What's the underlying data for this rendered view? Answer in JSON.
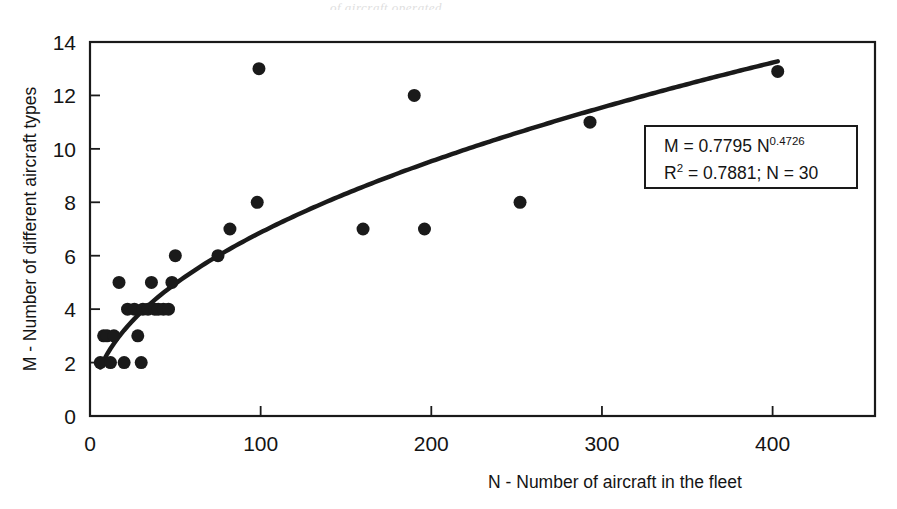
{
  "figure": {
    "background_color": "#ffffff",
    "ink_color": "#1a1a1a",
    "smudge_text": "of aircraft operated"
  },
  "chart_data": {
    "type": "scatter",
    "title": "",
    "subtitle": "",
    "xlabel": "N - Number of aircraft in the fleet",
    "ylabel": "M - Number of different aircraft types",
    "xlim": [
      0,
      460
    ],
    "ylim": [
      0,
      14
    ],
    "xticks": [
      0,
      100,
      200,
      300,
      400
    ],
    "yticks": [
      0,
      2,
      4,
      6,
      8,
      10,
      12,
      14
    ],
    "xtick_labels": [
      "0",
      "100",
      "200",
      "300",
      "400"
    ],
    "ytick_labels": [
      "0",
      "2",
      "4",
      "6",
      "8",
      "10",
      "12",
      "14"
    ],
    "grid": false,
    "legend": null,
    "marker": {
      "shape": "circle",
      "color": "#1a1a1a",
      "size_px": 13
    },
    "points": [
      {
        "x": 6,
        "y": 2
      },
      {
        "x": 8,
        "y": 3
      },
      {
        "x": 10,
        "y": 3
      },
      {
        "x": 12,
        "y": 2
      },
      {
        "x": 14,
        "y": 3
      },
      {
        "x": 17,
        "y": 5
      },
      {
        "x": 20,
        "y": 2
      },
      {
        "x": 22,
        "y": 4
      },
      {
        "x": 26,
        "y": 4
      },
      {
        "x": 30,
        "y": 2
      },
      {
        "x": 31,
        "y": 4
      },
      {
        "x": 34,
        "y": 4
      },
      {
        "x": 36,
        "y": 5
      },
      {
        "x": 38,
        "y": 4
      },
      {
        "x": 40,
        "y": 4
      },
      {
        "x": 43,
        "y": 4
      },
      {
        "x": 46,
        "y": 4
      },
      {
        "x": 50,
        "y": 6
      },
      {
        "x": 75,
        "y": 6
      },
      {
        "x": 82,
        "y": 7
      },
      {
        "x": 98,
        "y": 8
      },
      {
        "x": 99,
        "y": 13
      },
      {
        "x": 160,
        "y": 7
      },
      {
        "x": 190,
        "y": 12
      },
      {
        "x": 196,
        "y": 7
      },
      {
        "x": 252,
        "y": 8
      },
      {
        "x": 293,
        "y": 11
      },
      {
        "x": 403,
        "y": 12.9
      },
      {
        "x": 28,
        "y": 3
      },
      {
        "x": 48,
        "y": 5
      }
    ],
    "fit_curve": {
      "kind": "power",
      "formula": "M = 0.7795 * N^0.4726",
      "coefficient": 0.7795,
      "exponent": 0.4726,
      "x_start": 6,
      "x_end": 403,
      "line_width_px": 4.5,
      "color": "#1a1a1a"
    },
    "annotation_box": {
      "line1_prefix": "M = 0.7795 N",
      "line1_exponent": "0.4726",
      "line2_prefix": "R",
      "line2_superscript": "2",
      "line2_rest": " = 0.7881; N  = 30",
      "r_squared": 0.7881,
      "sample_size": 30,
      "border_color": "#1a1a1a"
    }
  }
}
